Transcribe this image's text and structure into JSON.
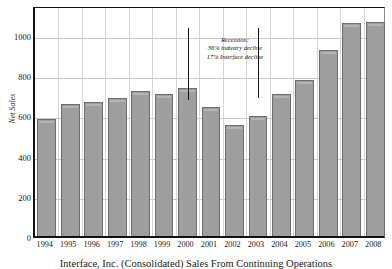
{
  "chart_data": {
    "type": "bar",
    "title": "",
    "caption": "Interface, Inc. (Consolidated) Sales From Continuing Operations",
    "xlabel": "",
    "ylabel": "Net Sales",
    "ylim": [
      0,
      1150
    ],
    "yticks": [
      0,
      200,
      400,
      600,
      800,
      1000
    ],
    "ytick_labels": [
      "0",
      "200",
      "400",
      "600",
      "800",
      "1000"
    ],
    "grid": true,
    "legend": "none",
    "categories": [
      "1994",
      "1995",
      "1996",
      "1997",
      "1998",
      "1999",
      "2000",
      "2001",
      "2002",
      "2003",
      "2004",
      "2005",
      "2006",
      "2007",
      "2008"
    ],
    "values": [
      585,
      655,
      665,
      685,
      720,
      705,
      735,
      640,
      555,
      595,
      705,
      775,
      925,
      1060,
      1065
    ],
    "annotations": [
      {
        "name": "recession-note",
        "lines": [
          "Recession:",
          "36% industry decline",
          "17% Interface decline"
        ],
        "line1": "Recession:",
        "line2": "36% industry decline",
        "line3": "17% Interface decline"
      }
    ],
    "markers": [
      {
        "name": "recession-start-marker",
        "category": "2000",
        "top_value": 1050,
        "bottom_value": 690
      },
      {
        "name": "recession-end-marker",
        "category": "2003",
        "top_value": 1050,
        "bottom_value": 700
      }
    ],
    "bar_color": "#9e9e9e",
    "bar_edge_color": "#6d6d6d",
    "grid_color": "#c9c9c9",
    "axis_color": "#111111"
  }
}
